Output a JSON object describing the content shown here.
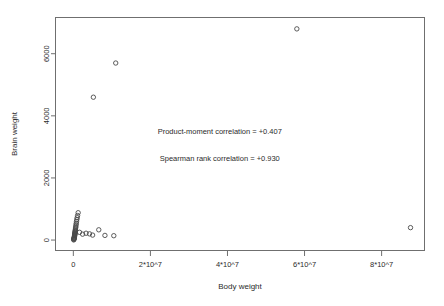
{
  "chart_data": {
    "type": "scatter",
    "title": "",
    "xlabel": "Body weight",
    "ylabel": "Brain weight",
    "xlim": [
      -4500000,
      91000000
    ],
    "ylim": [
      -320,
      7150
    ],
    "grid": false,
    "legend": null,
    "xticks": [
      0,
      20000000,
      40000000,
      60000000,
      80000000
    ],
    "xticklabels": [
      "0",
      "2*10^7",
      "4*10^7",
      "6*10^7",
      "8*10^7"
    ],
    "yticks": [
      0,
      2000,
      4000,
      6000
    ],
    "yticklabels": [
      "0",
      "2000",
      "4000",
      "6000"
    ],
    "marker": "open-circle",
    "marker_size": 2.2,
    "points": [
      {
        "x": 100000,
        "y": 5
      },
      {
        "x": 120000,
        "y": 20
      },
      {
        "x": 150000,
        "y": 35
      },
      {
        "x": 180000,
        "y": 50
      },
      {
        "x": 200000,
        "y": 60
      },
      {
        "x": 230000,
        "y": 75
      },
      {
        "x": 260000,
        "y": 90
      },
      {
        "x": 280000,
        "y": 105
      },
      {
        "x": 300000,
        "y": 120
      },
      {
        "x": 320000,
        "y": 140
      },
      {
        "x": 340000,
        "y": 160
      },
      {
        "x": 360000,
        "y": 175
      },
      {
        "x": 380000,
        "y": 190
      },
      {
        "x": 400000,
        "y": 210
      },
      {
        "x": 420000,
        "y": 230
      },
      {
        "x": 450000,
        "y": 250
      },
      {
        "x": 470000,
        "y": 275
      },
      {
        "x": 500000,
        "y": 300
      },
      {
        "x": 520000,
        "y": 330
      },
      {
        "x": 560000,
        "y": 360
      },
      {
        "x": 600000,
        "y": 400
      },
      {
        "x": 640000,
        "y": 440
      },
      {
        "x": 700000,
        "y": 490
      },
      {
        "x": 760000,
        "y": 540
      },
      {
        "x": 820000,
        "y": 600
      },
      {
        "x": 900000,
        "y": 660
      },
      {
        "x": 1000000,
        "y": 720
      },
      {
        "x": 1100000,
        "y": 790
      },
      {
        "x": 1250000,
        "y": 880
      },
      {
        "x": 1600000,
        "y": 250
      },
      {
        "x": 2400000,
        "y": 190
      },
      {
        "x": 3300000,
        "y": 220
      },
      {
        "x": 4200000,
        "y": 200
      },
      {
        "x": 5000000,
        "y": 160
      },
      {
        "x": 6600000,
        "y": 330
      },
      {
        "x": 8200000,
        "y": 150
      },
      {
        "x": 10500000,
        "y": 140
      },
      {
        "x": 5200000,
        "y": 4600
      },
      {
        "x": 11000000,
        "y": 5700
      },
      {
        "x": 58000000,
        "y": 6800
      },
      {
        "x": 87500000,
        "y": 400
      }
    ],
    "annotations": [
      {
        "text": "Product-moment correlation = +0.407",
        "x": 38000000,
        "y": 3420
      },
      {
        "text": "Spearman rank correlation = +0.930",
        "x": 38000000,
        "y": 2540
      }
    ]
  }
}
